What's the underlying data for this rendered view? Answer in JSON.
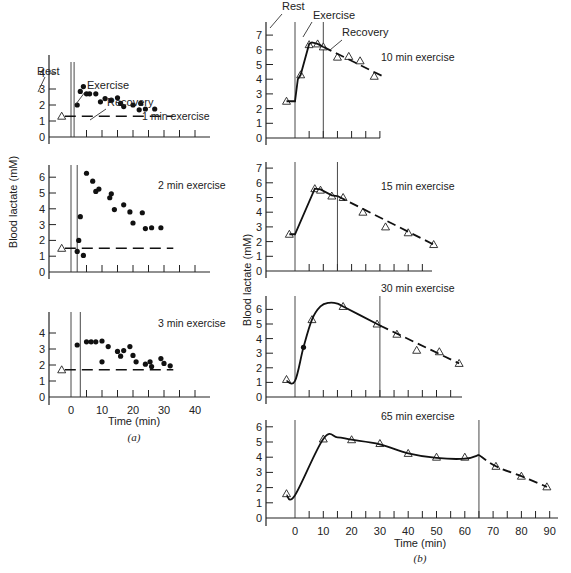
{
  "chart_data": [
    {
      "panel": "a",
      "type": "scatter",
      "title": "1 min exercise",
      "xlabel": "Time (min)",
      "ylabel": "Blood lactate (mM)",
      "ylim": [
        0,
        4.5
      ],
      "yticks": [
        0,
        1,
        2,
        3,
        4
      ],
      "xlim": [
        -5,
        45
      ],
      "xticks": [
        0,
        10,
        20,
        30,
        40
      ],
      "rest_value": 1.3,
      "exercise_start": 0,
      "exercise_end": 1,
      "annotations": [
        "Rest",
        "Exercise",
        "Recovery"
      ],
      "series": [
        {
          "name": "rest",
          "marker": "triangle",
          "x": [
            -3
          ],
          "y": [
            1.3
          ]
        },
        {
          "name": "recovery",
          "marker": "dot",
          "x": [
            2,
            3,
            4,
            5,
            6,
            8,
            9.5,
            11,
            13,
            15,
            16,
            17,
            20,
            22,
            22.5,
            24,
            27
          ],
          "y": [
            2.0,
            2.85,
            3.15,
            2.7,
            2.7,
            2.7,
            2.2,
            2.4,
            2.3,
            2.45,
            2.1,
            1.9,
            2.0,
            1.7,
            2.1,
            1.75,
            1.75
          ]
        },
        {
          "name": "baseline",
          "style": "dashed",
          "x": [
            -2,
            33
          ],
          "y": [
            1.3,
            1.3
          ]
        }
      ]
    },
    {
      "panel": "a",
      "type": "scatter",
      "title": "2 min exercise",
      "ylim": [
        0,
        6.8
      ],
      "yticks": [
        0,
        1,
        2,
        3,
        4,
        5,
        6
      ],
      "xlim": [
        -5,
        45
      ],
      "rest_value": 1.5,
      "exercise_start": 0,
      "exercise_end": 2,
      "series": [
        {
          "name": "rest",
          "marker": "triangle",
          "x": [
            -3
          ],
          "y": [
            1.5
          ]
        },
        {
          "name": "recovery",
          "marker": "dot",
          "x": [
            2,
            2.5,
            3,
            4,
            5,
            7,
            8,
            9,
            12.5,
            13,
            14,
            17,
            19,
            20,
            23,
            24,
            26,
            29
          ],
          "y": [
            1.3,
            2.0,
            3.5,
            1.05,
            6.25,
            5.75,
            5.1,
            5.25,
            4.7,
            4.95,
            3.95,
            4.25,
            3.8,
            3.1,
            3.75,
            2.75,
            2.8,
            2.8
          ]
        },
        {
          "name": "baseline",
          "style": "dashed",
          "x": [
            -2,
            33
          ],
          "y": [
            1.5,
            1.5
          ]
        }
      ]
    },
    {
      "panel": "a",
      "type": "scatter",
      "title": "3 min exercise",
      "ylim": [
        0,
        4.5
      ],
      "yticks": [
        0,
        1,
        2,
        3,
        4
      ],
      "xlim": [
        -5,
        45
      ],
      "xticks": [
        0,
        10,
        20,
        30,
        40
      ],
      "rest_value": 1.7,
      "exercise_start": 0,
      "exercise_end": 3,
      "series": [
        {
          "name": "rest",
          "marker": "triangle",
          "x": [
            -3
          ],
          "y": [
            1.7
          ]
        },
        {
          "name": "recovery",
          "marker": "dot",
          "x": [
            2,
            5,
            6.5,
            8,
            10,
            10,
            12,
            15,
            16,
            17,
            19,
            20,
            21,
            24,
            25.5,
            26,
            29,
            30,
            32
          ],
          "y": [
            3.25,
            3.45,
            3.45,
            3.45,
            3.5,
            2.2,
            3.15,
            2.85,
            2.55,
            2.9,
            3.15,
            2.6,
            2.2,
            2.05,
            2.2,
            1.9,
            2.4,
            2.1,
            1.95
          ]
        },
        {
          "name": "baseline",
          "style": "dashed",
          "x": [
            -2,
            33
          ],
          "y": [
            1.7,
            1.7
          ]
        }
      ]
    },
    {
      "panel": "b",
      "type": "line",
      "title": "10 min exercise",
      "ylabel": "Blood lactate (mM)",
      "ylim": [
        0,
        7.5
      ],
      "yticks": [
        0,
        1,
        2,
        3,
        4,
        5,
        6,
        7
      ],
      "exercise_start": 0,
      "exercise_end": 10,
      "annotations": [
        "Rest",
        "Exercise",
        "Recovery"
      ],
      "series": [
        {
          "name": "measured",
          "marker": "triangle",
          "x": [
            -3,
            2,
            5,
            8,
            10,
            15,
            19,
            23,
            28
          ],
          "y": [
            2.5,
            4.3,
            6.35,
            6.4,
            6.2,
            5.5,
            5.55,
            5.25,
            4.2
          ]
        },
        {
          "name": "exercise_curve",
          "style": "solid",
          "x": [
            -3,
            0,
            1,
            2,
            5,
            6,
            8,
            10
          ],
          "y": [
            2.5,
            2.5,
            4.0,
            4.3,
            6.4,
            6.5,
            6.4,
            6.2
          ]
        },
        {
          "name": "recovery_curve",
          "style": "dashed",
          "x": [
            10,
            31
          ],
          "y": [
            6.2,
            4.2
          ]
        }
      ]
    },
    {
      "panel": "b",
      "type": "line",
      "title": "15 min exercise",
      "ylim": [
        0,
        7.5
      ],
      "yticks": [
        0,
        1,
        2,
        3,
        4,
        5,
        6,
        7
      ],
      "exercise_start": 0,
      "exercise_end": 15,
      "series": [
        {
          "name": "measured",
          "marker": "triangle",
          "x": [
            -2,
            7,
            9,
            13,
            17,
            24,
            32,
            40,
            49
          ],
          "y": [
            2.5,
            5.6,
            5.5,
            5.1,
            5.0,
            4.0,
            3.0,
            2.6,
            1.8
          ]
        },
        {
          "name": "exercise_curve",
          "style": "solid",
          "x": [
            -2,
            0,
            7,
            9,
            13,
            15
          ],
          "y": [
            2.5,
            2.5,
            5.6,
            5.55,
            5.15,
            5.1
          ]
        },
        {
          "name": "recovery_curve",
          "style": "dashed",
          "x": [
            15,
            49
          ],
          "y": [
            5.1,
            1.8
          ]
        }
      ]
    },
    {
      "panel": "b",
      "type": "line",
      "title": "30 min exercise",
      "ylim": [
        0,
        7
      ],
      "yticks": [
        0,
        1,
        2,
        3,
        4,
        5,
        6
      ],
      "exercise_start": 0,
      "exercise_end": 30,
      "series": [
        {
          "name": "measured_triangle",
          "marker": "triangle",
          "x": [
            -3,
            6,
            17,
            29,
            36,
            43,
            51,
            58
          ],
          "y": [
            1.2,
            5.3,
            6.2,
            5.0,
            4.3,
            3.2,
            3.1,
            2.3
          ]
        },
        {
          "name": "measured_dot",
          "marker": "dot",
          "x": [
            3
          ],
          "y": [
            3.4
          ]
        },
        {
          "name": "exercise_curve",
          "style": "solid",
          "x": [
            -3,
            0,
            3,
            6,
            9,
            12,
            15,
            17,
            29,
            30
          ],
          "y": [
            1.1,
            1.1,
            3.4,
            5.3,
            6.2,
            6.45,
            6.4,
            6.2,
            5.0,
            4.9
          ]
        },
        {
          "name": "recovery_curve",
          "style": "dashed",
          "x": [
            30,
            58
          ],
          "y": [
            4.9,
            2.3
          ]
        }
      ]
    },
    {
      "panel": "b",
      "type": "line",
      "title": "65 min exercise",
      "xlabel": "Time (min)",
      "ylim": [
        0,
        7
      ],
      "yticks": [
        0,
        1,
        2,
        3,
        4,
        5,
        6
      ],
      "xlim": [
        -10,
        92
      ],
      "xticks": [
        0,
        10,
        20,
        30,
        40,
        50,
        60,
        70,
        80,
        90
      ],
      "exercise_start": 0,
      "exercise_end": 65,
      "series": [
        {
          "name": "measured",
          "marker": "triangle",
          "x": [
            -3,
            10,
            20,
            30,
            40,
            50,
            60,
            71,
            80,
            89
          ],
          "y": [
            1.6,
            5.2,
            5.15,
            4.9,
            4.25,
            4.0,
            4.0,
            3.4,
            2.75,
            2.05
          ]
        },
        {
          "name": "exercise_curve",
          "style": "solid",
          "x": [
            -3,
            0,
            10,
            15,
            20,
            30,
            40,
            50,
            60,
            65
          ],
          "y": [
            1.5,
            1.5,
            5.2,
            5.3,
            5.15,
            4.85,
            4.25,
            3.95,
            3.9,
            4.15
          ]
        },
        {
          "name": "recovery_curve",
          "style": "dashed",
          "x": [
            65,
            71,
            80,
            89
          ],
          "y": [
            4.15,
            3.4,
            2.75,
            2.05
          ]
        }
      ]
    }
  ],
  "labels": {
    "rest": "Rest",
    "exercise": "Exercise",
    "recovery": "Recovery",
    "ylabel": "Blood lactate (mM)",
    "xlabel": "Time (min)",
    "panel_a": "(a)",
    "panel_b": "(b)",
    "titles": [
      "1 min exercise",
      "2 min exercise",
      "3 min exercise",
      "10 min exercise",
      "15 min exercise",
      "30 min exercise",
      "65 min exercise"
    ],
    "left_xticks": [
      "0",
      "10",
      "20",
      "30",
      "40"
    ],
    "right_xticks": [
      "0",
      "10",
      "20",
      "30",
      "40",
      "50",
      "60",
      "70",
      "80",
      "90"
    ]
  }
}
